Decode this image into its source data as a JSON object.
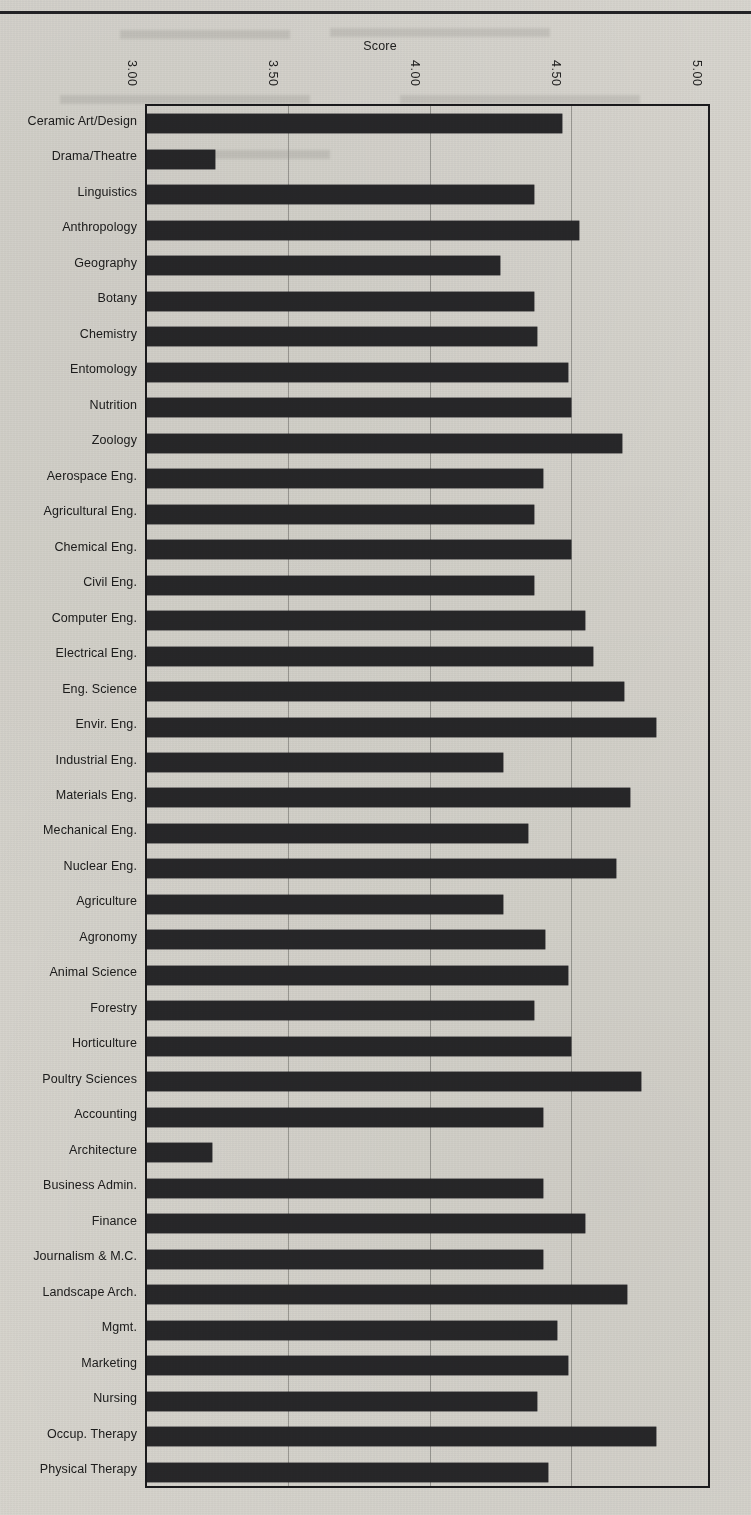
{
  "page": {
    "top_rule": "horizontal-rule"
  },
  "chart_data": {
    "type": "bar",
    "orientation": "horizontal",
    "title": "Score",
    "xlabel": "Score",
    "ylabel": "",
    "xlim": [
      3.0,
      5.0
    ],
    "xticks": [
      "3.00",
      "3.50",
      "4.00",
      "4.50",
      "5.00"
    ],
    "xtick_values": [
      3.0,
      3.5,
      4.0,
      4.5,
      5.0
    ],
    "grid": true,
    "grid_axis": "x",
    "legend": "none",
    "bar_color": "#2b2b2e",
    "axis_color": "#1d1d20",
    "categories": [
      "Ceramic Art/Design",
      "Drama/Theatre",
      "Linguistics",
      "Anthropology",
      "Geography",
      "Botany",
      "Chemistry",
      "Entomology",
      "Nutrition",
      "Zoology",
      "Aerospace Eng.",
      "Agricultural Eng.",
      "Chemical Eng.",
      "Civil Eng.",
      "Computer Eng.",
      "Electrical Eng.",
      "Eng. Science",
      "Envir. Eng.",
      "Industrial Eng.",
      "Materials  Eng.",
      "Mechanical Eng.",
      "Nuclear  Eng.",
      "Agriculture",
      "Agronomy",
      "Animal Science",
      "Forestry",
      "Horticulture",
      "Poultry Sciences",
      "Accounting",
      "Architecture",
      "Business Admin.",
      "Finance",
      "Journalism & M.C.",
      "Landscape Arch.",
      "Mgmt.",
      "Marketing",
      "Nursing",
      "Occup. Therapy",
      "Physical Therapy"
    ],
    "values": [
      4.47,
      3.24,
      4.37,
      4.53,
      4.25,
      4.37,
      4.38,
      4.49,
      4.5,
      4.68,
      4.4,
      4.37,
      4.5,
      4.37,
      4.55,
      4.58,
      4.69,
      4.8,
      4.26,
      4.71,
      4.35,
      4.66,
      4.26,
      4.41,
      4.49,
      4.37,
      4.5,
      4.75,
      4.4,
      3.23,
      4.4,
      4.55,
      4.4,
      4.7,
      4.45,
      4.49,
      4.38,
      4.8,
      4.42
    ]
  }
}
